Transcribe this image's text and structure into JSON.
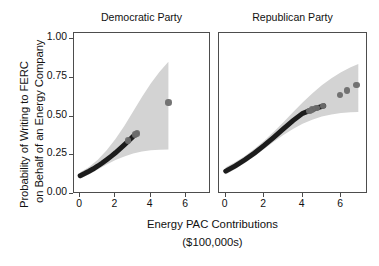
{
  "chart_data": {
    "type": "scatter",
    "title": "",
    "xlabel": "Energy PAC Contributions ($100,000s)",
    "xlabel_line1": "Energy PAC Contributions",
    "xlabel_line2": "($100,000s)",
    "ylabel": "Probability of Writing to FERC on Behalf of an Energy Company",
    "ylabel_line1": "Probability of Writing to FERC",
    "ylabel_line2": "on Behalf of an Energy Company",
    "grid": false,
    "legend": "none",
    "xlim": [
      -0.35,
      7.3
    ],
    "ylim": [
      0.0,
      1.04
    ],
    "xticks": [
      0,
      2,
      4,
      6
    ],
    "xticklabels": [
      "0",
      "2",
      "4",
      "6"
    ],
    "yticks": [
      0.0,
      0.25,
      0.5,
      0.75,
      1.0
    ],
    "yticklabels": [
      "0.00",
      "0.25",
      "0.50",
      "0.75",
      "1.00"
    ],
    "colors": {
      "band": "#d3d3d3",
      "point": "#6d6d6d",
      "dense_fit": "#1c1c1c",
      "axis": "#4d4d4d",
      "text": "#111111",
      "background": "#ffffff"
    },
    "facets": [
      {
        "label": "Democratic Party",
        "fit": {
          "x": [
            0.0,
            0.25,
            0.5,
            0.75,
            1.0,
            1.25,
            1.5,
            1.75,
            2.0,
            2.25,
            2.5,
            2.75,
            3.0,
            3.2,
            5.0
          ],
          "y": [
            0.118,
            0.132,
            0.147,
            0.163,
            0.181,
            0.2,
            0.221,
            0.243,
            0.266,
            0.291,
            0.317,
            0.344,
            0.372,
            0.39,
            0.59
          ]
        },
        "band_lower": {
          "x": [
            0.0,
            0.5,
            1.0,
            1.5,
            2.0,
            2.5,
            3.0,
            3.5,
            4.0,
            4.5,
            5.0
          ],
          "y": [
            0.098,
            0.126,
            0.159,
            0.191,
            0.219,
            0.243,
            0.261,
            0.274,
            0.282,
            0.286,
            0.288
          ]
        },
        "band_upper": {
          "x": [
            0.0,
            0.5,
            1.0,
            1.5,
            2.0,
            2.5,
            3.0,
            3.5,
            4.0,
            4.5,
            5.0
          ],
          "y": [
            0.14,
            0.175,
            0.222,
            0.283,
            0.356,
            0.44,
            0.533,
            0.627,
            0.714,
            0.79,
            0.855
          ]
        },
        "points": [
          {
            "x": 2.7,
            "y": 0.345
          },
          {
            "x": 3.12,
            "y": 0.385
          },
          {
            "x": 3.22,
            "y": 0.39
          },
          {
            "x": 5.0,
            "y": 0.59
          }
        ]
      },
      {
        "label": "Republican Party",
        "fit": {
          "x": [
            0.0,
            0.5,
            1.0,
            1.5,
            2.0,
            2.5,
            3.0,
            3.5,
            4.0,
            4.4,
            4.8,
            5.1
          ],
          "y": [
            0.148,
            0.182,
            0.221,
            0.265,
            0.314,
            0.366,
            0.42,
            0.474,
            0.521,
            0.54,
            0.558,
            0.57
          ]
        },
        "band_lower": {
          "x": [
            0.0,
            0.5,
            1.0,
            1.5,
            2.0,
            2.5,
            3.0,
            3.5,
            4.0,
            4.5,
            5.0,
            5.5,
            6.0,
            6.5,
            6.9
          ],
          "y": [
            0.126,
            0.161,
            0.2,
            0.244,
            0.291,
            0.337,
            0.381,
            0.42,
            0.453,
            0.48,
            0.5,
            0.514,
            0.523,
            0.528,
            0.53
          ]
        },
        "band_upper": {
          "x": [
            0.0,
            0.5,
            1.0,
            1.5,
            2.0,
            2.5,
            3.0,
            3.5,
            4.0,
            4.5,
            5.0,
            5.5,
            6.0,
            6.5,
            6.9
          ],
          "y": [
            0.172,
            0.206,
            0.246,
            0.292,
            0.344,
            0.402,
            0.464,
            0.528,
            0.591,
            0.65,
            0.703,
            0.748,
            0.786,
            0.818,
            0.84
          ]
        },
        "points": [
          {
            "x": 4.35,
            "y": 0.537
          },
          {
            "x": 4.5,
            "y": 0.545
          },
          {
            "x": 4.72,
            "y": 0.556
          },
          {
            "x": 5.05,
            "y": 0.568
          },
          {
            "x": 5.95,
            "y": 0.64
          },
          {
            "x": 6.3,
            "y": 0.668
          },
          {
            "x": 6.8,
            "y": 0.705
          }
        ]
      }
    ]
  },
  "axes": {
    "ytitle_line1": "Probability of Writing to FERC",
    "ytitle_line2": "on Behalf of an Energy Company",
    "xtitle_line1": "Energy PAC Contributions",
    "xtitle_line2": "($100,000s)",
    "yticklabels": [
      "1.00",
      "0.75",
      "0.50",
      "0.25",
      "0.00"
    ],
    "xticklabels": [
      "0",
      "2",
      "4",
      "6"
    ]
  },
  "facet_titles": {
    "left": "Democratic Party",
    "right": "Republican Party"
  }
}
